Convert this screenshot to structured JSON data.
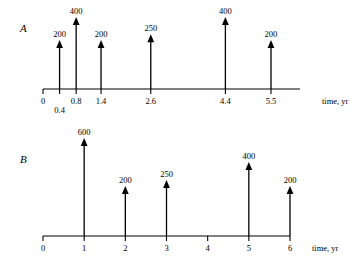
{
  "figure": {
    "background_color": "#ffffff",
    "ink_color": "#000000",
    "panels": [
      {
        "letter": "A",
        "axis_title": "time, yr",
        "tick_labels": [
          "0",
          "0.4",
          "0.8",
          "1.4",
          "2.6",
          "4.4",
          "5.5"
        ],
        "tick_values": [
          0,
          0.4,
          0.8,
          1.4,
          2.6,
          4.4,
          5.5
        ],
        "arrow_labels": [
          "200",
          "400",
          "200",
          "250",
          "400",
          "200"
        ],
        "arrow_times": [
          0.4,
          0.8,
          1.4,
          2.6,
          4.4,
          5.5
        ],
        "arrow_values": [
          200,
          400,
          200,
          250,
          400,
          200
        ]
      },
      {
        "letter": "B",
        "axis_title": "time, yr",
        "tick_labels": [
          "0",
          "1",
          "2",
          "3",
          "4",
          "5",
          "6"
        ],
        "tick_values": [
          0,
          1,
          2,
          3,
          4,
          5,
          6
        ],
        "arrow_labels": [
          "600",
          "200",
          "250",
          "400",
          "200"
        ],
        "arrow_times": [
          1,
          2,
          3,
          5,
          6
        ],
        "arrow_values": [
          600,
          200,
          250,
          400,
          200
        ]
      }
    ]
  },
  "chart_data": {
    "type": "bar",
    "title": "",
    "xlabel": "time, yr",
    "ylabel": "",
    "charts": [
      {
        "panel": "A",
        "type": "bar",
        "xlabel": "time, yr",
        "categories": [
          "0.4",
          "0.8",
          "1.4",
          "2.6",
          "4.4",
          "5.5"
        ],
        "x": [
          0.4,
          0.8,
          1.4,
          2.6,
          4.4,
          5.5
        ],
        "values": [
          200,
          400,
          200,
          250,
          400,
          200
        ],
        "axis_ticks": [
          0,
          0.4,
          0.8,
          1.4,
          2.6,
          4.4,
          5.5
        ],
        "axis_tick_labels": [
          "0",
          "0.4",
          "0.8",
          "1.4",
          "2.6",
          "4.4",
          "5.5"
        ],
        "xlim": [
          0,
          6
        ],
        "grid": false,
        "legend": "none",
        "note": "cash-flow diagram: upward arrows at non-uniform times"
      },
      {
        "panel": "B",
        "type": "bar",
        "xlabel": "time, yr",
        "categories": [
          "1",
          "2",
          "3",
          "5",
          "6"
        ],
        "x": [
          1,
          2,
          3,
          5,
          6
        ],
        "values": [
          600,
          200,
          250,
          400,
          200
        ],
        "axis_ticks": [
          0,
          1,
          2,
          3,
          4,
          5,
          6
        ],
        "axis_tick_labels": [
          "0",
          "1",
          "2",
          "3",
          "4",
          "5",
          "6"
        ],
        "xlim": [
          0,
          6
        ],
        "grid": false,
        "legend": "none",
        "note": "cash-flow diagram: upward arrows at integer years, none at year 4"
      }
    ]
  }
}
